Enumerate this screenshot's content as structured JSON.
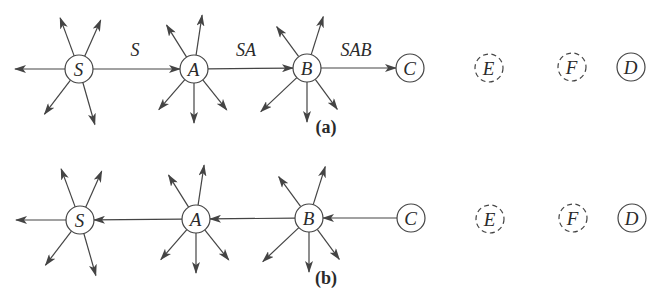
{
  "diagram": {
    "stroke_color": "#444444",
    "background": "#ffffff",
    "node_radius": 14,
    "panels": [
      {
        "id": "a",
        "caption": "(a)",
        "caption_pos": [
          326,
          133
        ],
        "nodes": [
          {
            "id": "S",
            "label": "S",
            "x": 79,
            "y": 69,
            "style": "solid",
            "fanout": true
          },
          {
            "id": "A",
            "label": "A",
            "x": 194,
            "y": 69,
            "style": "solid",
            "fanout": true
          },
          {
            "id": "B",
            "label": "B",
            "x": 307,
            "y": 68,
            "style": "solid",
            "fanout": true
          },
          {
            "id": "C",
            "label": "C",
            "x": 410,
            "y": 68,
            "style": "solid",
            "fanout": false
          },
          {
            "id": "E",
            "label": "E",
            "x": 489,
            "y": 68,
            "style": "dashed",
            "fanout": false
          },
          {
            "id": "F",
            "label": "F",
            "x": 572,
            "y": 67,
            "style": "dashed",
            "fanout": false
          },
          {
            "id": "D",
            "label": "D",
            "x": 631,
            "y": 67,
            "style": "solid",
            "fanout": false
          }
        ],
        "edges": [
          {
            "from": "S",
            "to": "A",
            "label": "S",
            "label_pos": [
              135,
              56
            ]
          },
          {
            "from": "A",
            "to": "B",
            "label": "SA",
            "label_pos": [
              246,
              56
            ]
          },
          {
            "from": "B",
            "to": "C",
            "label": "SAB",
            "label_pos": [
              356,
              56
            ]
          }
        ]
      },
      {
        "id": "b",
        "caption": "(b)",
        "caption_pos": [
          326,
          284
        ],
        "nodes": [
          {
            "id": "S",
            "label": "S",
            "x": 80,
            "y": 220,
            "style": "solid",
            "fanout": true
          },
          {
            "id": "A",
            "label": "A",
            "x": 196,
            "y": 219,
            "style": "solid",
            "fanout": true
          },
          {
            "id": "B",
            "label": "B",
            "x": 309,
            "y": 218,
            "style": "solid",
            "fanout": true
          },
          {
            "id": "C",
            "label": "C",
            "x": 411,
            "y": 218,
            "style": "solid",
            "fanout": false
          },
          {
            "id": "E",
            "label": "E",
            "x": 490,
            "y": 219,
            "style": "dashed",
            "fanout": false
          },
          {
            "id": "F",
            "label": "F",
            "x": 573,
            "y": 218,
            "style": "dashed",
            "fanout": false
          },
          {
            "id": "D",
            "label": "D",
            "x": 632,
            "y": 218,
            "style": "solid",
            "fanout": false
          }
        ],
        "edges": [
          {
            "from": "C",
            "to": "B",
            "label": ""
          },
          {
            "from": "B",
            "to": "A",
            "label": ""
          },
          {
            "from": "A",
            "to": "S",
            "label": ""
          }
        ]
      }
    ],
    "fanout_arrows": {
      "S": [
        [
          -50,
          0
        ],
        [
          -14,
          -38
        ],
        [
          16,
          -36
        ],
        [
          -26,
          34
        ],
        [
          12,
          42
        ]
      ],
      "A": [
        [
          -20,
          -32
        ],
        [
          6,
          -40
        ],
        [
          -26,
          30
        ],
        [
          0,
          40
        ],
        [
          24,
          30
        ]
      ],
      "B": [
        [
          -22,
          -30
        ],
        [
          12,
          -38
        ],
        [
          -36,
          34
        ],
        [
          0,
          40
        ],
        [
          22,
          30
        ]
      ]
    }
  }
}
